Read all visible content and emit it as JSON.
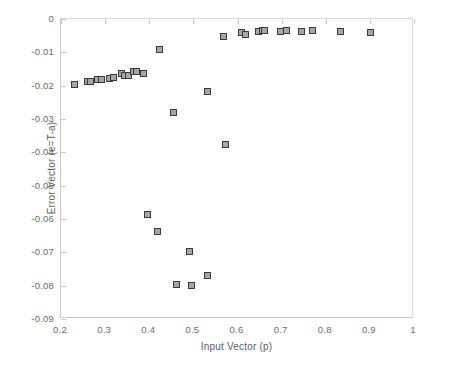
{
  "chart_data": {
    "type": "scatter",
    "title": "",
    "xlabel": "Input Vector (p)",
    "ylabel": "Error Vector (e=T-a)",
    "xlim": [
      0.2,
      1.0
    ],
    "ylim": [
      -0.09,
      0.0
    ],
    "xticks": [
      0.2,
      0.3,
      0.4,
      0.5,
      0.6,
      0.7,
      0.8,
      0.9,
      1
    ],
    "xticklabels": [
      "0.2",
      "0.3",
      "0.4",
      "0.5",
      "0.6",
      "0.7",
      "0.8",
      "0.9",
      "1"
    ],
    "yticks": [
      0,
      -0.01,
      -0.02,
      -0.03,
      -0.04,
      -0.05,
      -0.06,
      -0.07,
      -0.08,
      -0.09
    ],
    "yticklabels": [
      "0",
      "-0.01",
      "-0.02",
      "-0.03",
      "-0.04",
      "-0.05",
      "-0.06",
      "-0.07",
      "-0.08",
      "-0.09"
    ],
    "grid": false,
    "legend": null,
    "marker": {
      "shape": "square",
      "face_color": "#a6a6a6",
      "edge_color": "#3a3a3a",
      "size_px": 7
    },
    "series": [
      {
        "name": "error",
        "points": [
          [
            0.231,
            -0.0196
          ],
          [
            0.259,
            -0.0188
          ],
          [
            0.266,
            -0.0188
          ],
          [
            0.283,
            -0.0182
          ],
          [
            0.291,
            -0.0181
          ],
          [
            0.309,
            -0.0177
          ],
          [
            0.318,
            -0.0176
          ],
          [
            0.337,
            -0.0162
          ],
          [
            0.345,
            -0.017
          ],
          [
            0.353,
            -0.0169
          ],
          [
            0.364,
            -0.0156
          ],
          [
            0.372,
            -0.0158
          ],
          [
            0.387,
            -0.0164
          ],
          [
            0.397,
            -0.0586
          ],
          [
            0.418,
            -0.0638
          ],
          [
            0.424,
            -0.0091
          ],
          [
            0.456,
            -0.028
          ],
          [
            0.461,
            -0.0795
          ],
          [
            0.492,
            -0.0697
          ],
          [
            0.495,
            -0.08
          ],
          [
            0.531,
            -0.0218
          ],
          [
            0.533,
            -0.0769
          ],
          [
            0.569,
            -0.0051
          ],
          [
            0.573,
            -0.0375
          ],
          [
            0.609,
            -0.004
          ],
          [
            0.617,
            -0.0045
          ],
          [
            0.648,
            -0.0037
          ],
          [
            0.656,
            -0.0035
          ],
          [
            0.662,
            -0.0034
          ],
          [
            0.697,
            -0.0038
          ],
          [
            0.712,
            -0.0034
          ],
          [
            0.745,
            -0.0038
          ],
          [
            0.77,
            -0.0035
          ],
          [
            0.833,
            -0.0038
          ],
          [
            0.901,
            -0.0041
          ]
        ]
      }
    ]
  }
}
